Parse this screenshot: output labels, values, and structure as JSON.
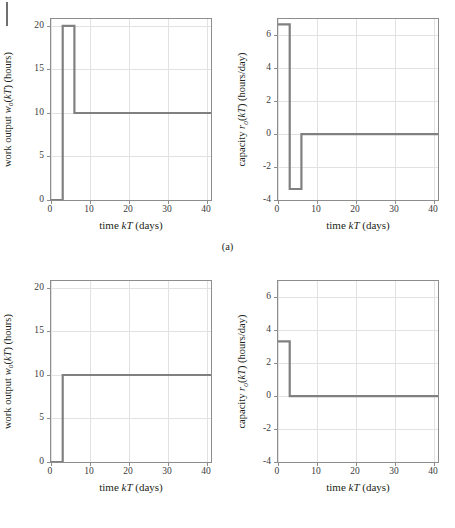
{
  "page": {
    "margin_rule": "page-margin-rule"
  },
  "figures": [
    {
      "id": "a",
      "caption": "(a)",
      "panels": [
        {
          "id": "a-left",
          "chart_data": {
            "type": "line",
            "title": "",
            "xlabel_parts": {
              "pre": "time ",
              "math": "kT",
              "post": " (days)"
            },
            "ylabel_parts": {
              "pre": "work output ",
              "math": "w",
              "sub": "o",
              "mid": "(",
              "math2": "kT",
              "post": ") (hours)"
            },
            "xlabel": "time kT (days)",
            "ylabel": "work output w_o(kT) (hours)",
            "xlim": [
              0,
              41
            ],
            "ylim": [
              0,
              20.8
            ],
            "xticks": [
              0,
              10,
              20,
              30,
              40
            ],
            "xticklabels": [
              "0",
              "10",
              "20",
              "30",
              "40"
            ],
            "yticks": [
              0,
              5,
              10,
              15,
              20
            ],
            "yticklabels": [
              "0",
              "5",
              "10",
              "15",
              "20"
            ],
            "grid": true,
            "legend": "none",
            "series": [
              {
                "name": "work output",
                "color": "#808080",
                "step": "post",
                "x": [
                  0,
                  3,
                  6,
                  41
                ],
                "y": [
                  0,
                  20,
                  10,
                  10
                ]
              }
            ]
          }
        },
        {
          "id": "a-right",
          "chart_data": {
            "type": "line",
            "title": "",
            "xlabel_parts": {
              "pre": "time ",
              "math": "kT",
              "post": " (days)"
            },
            "ylabel_parts": {
              "pre": "capacity ",
              "math": "r",
              "sub": "o",
              "mid": "(",
              "math2": "kT",
              "post": ") (hours/day)"
            },
            "xlabel": "time kT (days)",
            "ylabel": "capacity r_o(kT) (hours/day)",
            "xlim": [
              0,
              41
            ],
            "ylim": [
              -4,
              7
            ],
            "xticks": [
              0,
              10,
              20,
              30,
              40
            ],
            "xticklabels": [
              "0",
              "10",
              "20",
              "30",
              "40"
            ],
            "yticks": [
              -4,
              -2,
              0,
              2,
              4,
              6
            ],
            "yticklabels": [
              "-4",
              "-2",
              "0",
              "2",
              "4",
              "6"
            ],
            "grid": true,
            "legend": "none",
            "series": [
              {
                "name": "capacity",
                "color": "#808080",
                "step": "post",
                "x": [
                  0,
                  3,
                  6,
                  41
                ],
                "y": [
                  6.67,
                  -3.33,
                  0,
                  0
                ]
              }
            ]
          }
        }
      ]
    },
    {
      "id": "b",
      "caption": "(b)",
      "panels": [
        {
          "id": "b-left",
          "chart_data": {
            "type": "line",
            "title": "",
            "xlabel_parts": {
              "pre": "time ",
              "math": "kT",
              "post": " (days)"
            },
            "ylabel_parts": {
              "pre": "work output ",
              "math": "w",
              "sub": "o",
              "mid": "(",
              "math2": "kT",
              "post": ") (hours)"
            },
            "xlabel": "time kT (days)",
            "ylabel": "work output w_o(kT) (hours)",
            "xlim": [
              0,
              41
            ],
            "ylim": [
              0,
              20.8
            ],
            "xticks": [
              0,
              10,
              20,
              30,
              40
            ],
            "xticklabels": [
              "0",
              "10",
              "20",
              "30",
              "40"
            ],
            "yticks": [
              0,
              5,
              10,
              15,
              20
            ],
            "yticklabels": [
              "0",
              "5",
              "10",
              "15",
              "20"
            ],
            "grid": true,
            "legend": "none",
            "series": [
              {
                "name": "work output",
                "color": "#808080",
                "step": "post",
                "x": [
                  0,
                  3,
                  41
                ],
                "y": [
                  0,
                  10,
                  10
                ]
              }
            ]
          }
        },
        {
          "id": "b-right",
          "chart_data": {
            "type": "line",
            "title": "",
            "xlabel_parts": {
              "pre": "time ",
              "math": "kT",
              "post": " (days)"
            },
            "ylabel_parts": {
              "pre": "capacity ",
              "math": "r",
              "sub": "o",
              "mid": "(",
              "math2": "kT",
              "post": ") (hours/day)"
            },
            "xlabel": "time kT (days)",
            "ylabel": "capacity r_o(kT) (hours/day)",
            "xlim": [
              0,
              41
            ],
            "ylim": [
              -4,
              7
            ],
            "xticks": [
              0,
              10,
              20,
              30,
              40
            ],
            "xticklabels": [
              "0",
              "10",
              "20",
              "30",
              "40"
            ],
            "yticks": [
              -4,
              -2,
              0,
              2,
              4,
              6
            ],
            "yticklabels": [
              "-4",
              "-2",
              "0",
              "2",
              "4",
              "6"
            ],
            "grid": true,
            "legend": "none",
            "series": [
              {
                "name": "capacity",
                "color": "#808080",
                "step": "post",
                "x": [
                  0,
                  3,
                  41
                ],
                "y": [
                  3.33,
                  0,
                  0
                ]
              }
            ]
          }
        }
      ]
    }
  ],
  "style": {
    "series_color": "#808080",
    "axis_color": "#8d8d8d",
    "grid_color": "#e2e2e2",
    "text_color": "#231f20",
    "background": "#ffffff"
  }
}
